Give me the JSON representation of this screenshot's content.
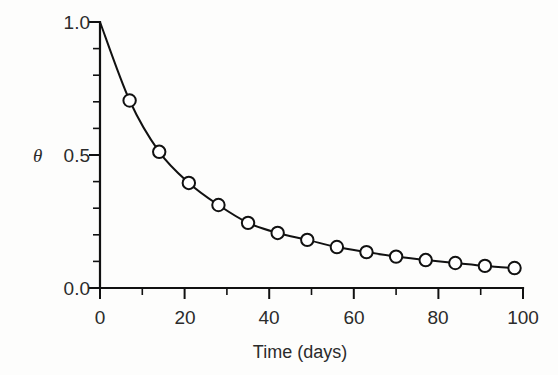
{
  "chart_data": {
    "type": "line",
    "title": "",
    "subtitle": "",
    "xlabel": "Time (days)",
    "ylabel": "θ",
    "xlim": [
      0,
      100
    ],
    "ylim": [
      0.0,
      1.0
    ],
    "grid": false,
    "legend": null,
    "x_ticks_major": [
      0,
      20,
      40,
      60,
      80,
      100
    ],
    "x_tick_labels": [
      "0",
      "20",
      "40",
      "60",
      "80",
      "100"
    ],
    "x_ticks_minor": [
      10,
      30,
      50,
      70,
      90
    ],
    "y_ticks_major": [
      0.0,
      0.5,
      1.0
    ],
    "y_tick_labels": [
      "0.0",
      "0.5",
      "1.0"
    ],
    "y_ticks_minor": [
      0.1,
      0.2,
      0.3,
      0.4,
      0.6,
      0.7,
      0.8,
      0.9
    ],
    "marker": "circle-open",
    "line_color": "#111111",
    "marker_face_color": "#ffffff",
    "marker_edge_color": "#111111",
    "curve_start": {
      "x": 0,
      "y": 1.0
    },
    "x": [
      0,
      7,
      14,
      21,
      28,
      35,
      42,
      49,
      56,
      63,
      70,
      77,
      84,
      91,
      98
    ],
    "values": [
      1.0,
      0.705,
      0.512,
      0.395,
      0.312,
      0.245,
      0.207,
      0.181,
      0.154,
      0.135,
      0.118,
      0.105,
      0.094,
      0.083,
      0.075
    ],
    "points": [
      {
        "x": 7,
        "y": 0.705
      },
      {
        "x": 14,
        "y": 0.512
      },
      {
        "x": 21,
        "y": 0.395
      },
      {
        "x": 28,
        "y": 0.312
      },
      {
        "x": 35,
        "y": 0.245
      },
      {
        "x": 42,
        "y": 0.207
      },
      {
        "x": 49,
        "y": 0.181
      },
      {
        "x": 56,
        "y": 0.154
      },
      {
        "x": 63,
        "y": 0.135
      },
      {
        "x": 70,
        "y": 0.118
      },
      {
        "x": 77,
        "y": 0.105
      },
      {
        "x": 84,
        "y": 0.094
      },
      {
        "x": 91,
        "y": 0.083
      },
      {
        "x": 98,
        "y": 0.075
      }
    ]
  },
  "labels": {
    "y_symbol": "θ",
    "y_0": "0.0",
    "y_5": "0.5",
    "y_10": "1.0",
    "x_0": "0",
    "x_20": "20",
    "x_40": "40",
    "x_60": "60",
    "x_80": "80",
    "x_100": "100",
    "x_title": "Time (days)"
  }
}
